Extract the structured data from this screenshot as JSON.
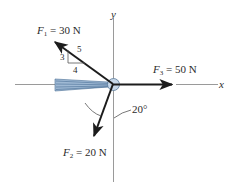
{
  "diagram": {
    "type": "force-diagram",
    "axes": {
      "x_label": "x",
      "y_label": "y"
    },
    "forces": [
      {
        "name": "F1",
        "symbol": "F",
        "subscript": "1",
        "equals": "=",
        "value": "30 N",
        "direction": "upper-left",
        "slope_triangle": {
          "rise": "3",
          "run": "4",
          "hyp": "5"
        }
      },
      {
        "name": "F2",
        "symbol": "F",
        "subscript": "2",
        "equals": "=",
        "value": "20 N",
        "direction": "down-left",
        "angle_from_negative_y": "20°"
      },
      {
        "name": "F3",
        "symbol": "F",
        "subscript": "3",
        "equals": "=",
        "value": "50 N",
        "direction": "positive-x"
      }
    ],
    "angle_label": "20°",
    "colors": {
      "arrow": "#1c1c1c",
      "axis": "#8a8a8a",
      "cable": "#7fa1c4",
      "cable_dark": "#4a6f96",
      "ring": "#b9cde0",
      "text": "#2b2b2b"
    }
  }
}
